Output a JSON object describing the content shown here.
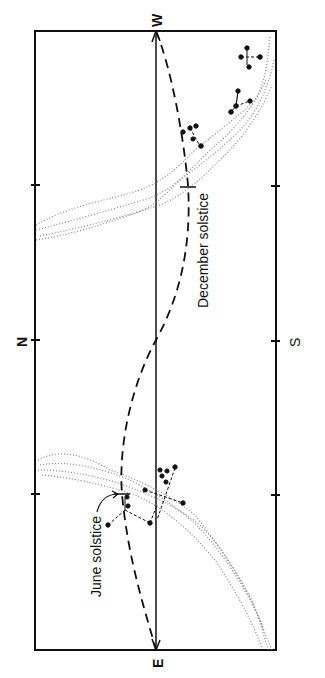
{
  "figure": {
    "type": "horizon sky diagram (rotated 90°)",
    "compass": {
      "west": "W",
      "east": "E",
      "north": "N",
      "south": "S"
    },
    "annotations": {
      "december_solstice": "December solstice",
      "june_solstice": "June solstice"
    },
    "colors": {
      "line": "#111111",
      "milky_way_dots": "#777777",
      "background": "#ffffff"
    },
    "elements": [
      "rectangular frame (horizon to zenith)",
      "central meridian line from E to W",
      "dashed sun path (arc) from E to W",
      "two dotted Milky Way bands",
      "star asterisms (dots joined by dashed lines)",
      "tick marks at quarter positions"
    ]
  }
}
